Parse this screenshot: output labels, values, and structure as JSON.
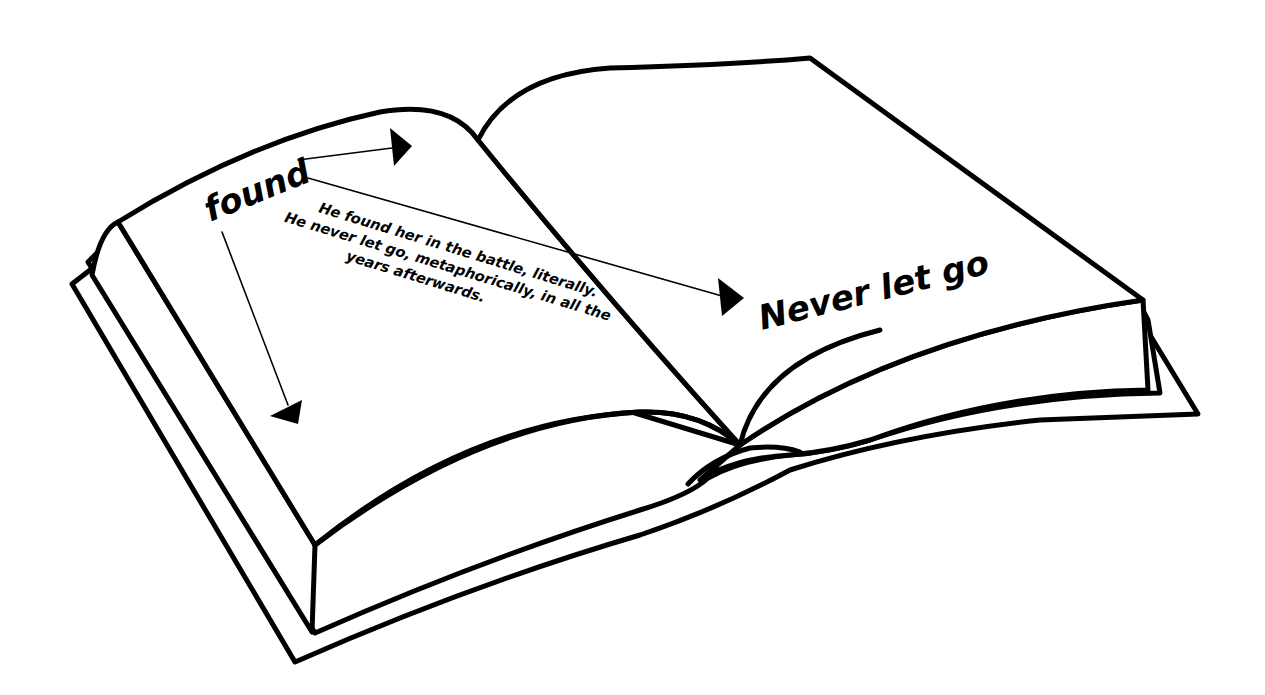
{
  "illustration": {
    "subject": "open-book",
    "stroke_color": "#000000",
    "background_color": "#ffffff"
  },
  "annotations": {
    "keyword_left": "found",
    "keyword_right": "Never let go",
    "note_lines": [
      "He found her in the battle, literally.",
      "He never let go, metaphorically, in all the",
      "years afterwards."
    ]
  },
  "arrows": [
    {
      "from": "found",
      "direction": "right",
      "target": "left-page-top"
    },
    {
      "from": "found",
      "direction": "down",
      "target": "left-page-body"
    },
    {
      "from": "found",
      "direction": "right-down",
      "target": "Never let go"
    }
  ]
}
